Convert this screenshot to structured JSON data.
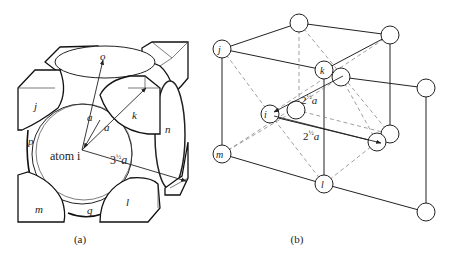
{
  "figure": {
    "panels": [
      {
        "id": "a",
        "caption": "(a)",
        "description": "Cube of body-centered atom i with surrounding atoms and distance vectors",
        "labels": {
          "atom_center": "atom i",
          "o": "o",
          "j": "j",
          "k": "k",
          "n": "n",
          "p": "p",
          "m": "m",
          "q": "q",
          "l": "l",
          "a1": "a",
          "a2": "a",
          "dist_long_base": "3",
          "dist_long_exp": "½",
          "dist_long_var": "a"
        }
      },
      {
        "id": "b",
        "caption": "(b)",
        "description": "Lattice of atom positions with nearest-neighbor distances",
        "labels": {
          "j": "j",
          "k": "k",
          "i": "i",
          "m": "m",
          "l": "l",
          "dist_upper_base": "2",
          "dist_upper_exp": "½",
          "dist_upper_var": "a",
          "dist_lower_base": "2",
          "dist_lower_exp": "½",
          "dist_lower_var": "a"
        }
      }
    ]
  }
}
